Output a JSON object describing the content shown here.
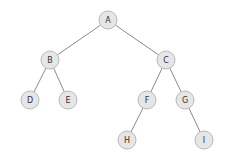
{
  "diagram": {
    "type": "binary-tree",
    "colors": {
      "background": "#ffffff",
      "node_fill": "#e6e6e6",
      "node_stroke": "#b8b8b8",
      "edge": "#8a8a8a",
      "label": "#333333"
    },
    "node_radius": 9,
    "nodes": [
      {
        "id": "A",
        "label": "A",
        "x": 108,
        "y": 20
      },
      {
        "id": "B",
        "label": "B",
        "x": 50,
        "y": 60
      },
      {
        "id": "C",
        "label": "C",
        "x": 166,
        "y": 60
      },
      {
        "id": "D",
        "label": "D",
        "x": 30,
        "y": 100
      },
      {
        "id": "E",
        "label": "E",
        "x": 68,
        "y": 100
      },
      {
        "id": "F",
        "label": "F",
        "x": 147,
        "y": 100
      },
      {
        "id": "G",
        "label": "G",
        "x": 185,
        "y": 100
      },
      {
        "id": "H",
        "label": "H",
        "x": 127,
        "y": 140
      },
      {
        "id": "I",
        "label": "I",
        "x": 204,
        "y": 140
      }
    ],
    "edges": [
      {
        "from": "A",
        "to": "B"
      },
      {
        "from": "A",
        "to": "C"
      },
      {
        "from": "B",
        "to": "D"
      },
      {
        "from": "B",
        "to": "E"
      },
      {
        "from": "C",
        "to": "F"
      },
      {
        "from": "C",
        "to": "G"
      },
      {
        "from": "F",
        "to": "H"
      },
      {
        "from": "G",
        "to": "I"
      }
    ]
  }
}
